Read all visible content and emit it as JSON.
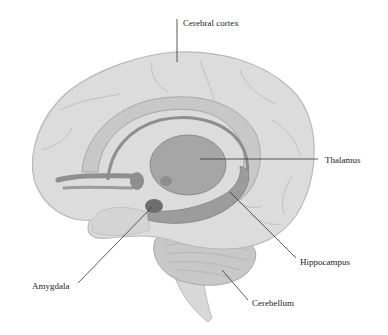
{
  "diagram": {
    "type": "anatomical-illustration",
    "labels": [
      {
        "id": "cerebral-cortex",
        "text": "Cerebral cortex",
        "x": 183,
        "y": 20
      },
      {
        "id": "thalamus",
        "text": "Thalamus",
        "x": 325,
        "y": 157
      },
      {
        "id": "hippocampus",
        "text": "Hippocampus",
        "x": 300,
        "y": 258
      },
      {
        "id": "amygdala",
        "text": "Amygdala",
        "x": 32,
        "y": 283
      },
      {
        "id": "cerebellum",
        "text": "Cerebellum",
        "x": 252,
        "y": 300
      }
    ],
    "colors": {
      "background": "#ffffff",
      "cortex_fill": "#dcdcdc",
      "cortex_stroke": "#b8b8b8",
      "limbic_band": "#c4c4c4",
      "fornix": "#8e8e8e",
      "thalamus": "#a6a6a6",
      "amygdala": "#6e6e6e",
      "cerebellum": "#c8c8c8",
      "brainstem": "#d8d8d8",
      "leader_line": "#333333",
      "label_text": "#222222"
    }
  }
}
